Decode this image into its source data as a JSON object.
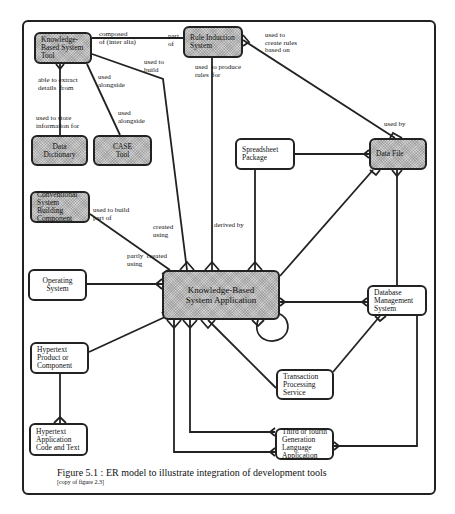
{
  "diagram": {
    "type": "ER model",
    "entities": [
      {
        "id": "kbs_tool",
        "label": "Knowledge-Based System Tool",
        "shaded": true
      },
      {
        "id": "rule_induction",
        "label": "Rule Induction System",
        "shaded": true
      },
      {
        "id": "data_dictionary",
        "label": "Data Dictionary",
        "shaded": true
      },
      {
        "id": "case_tool",
        "label": "CASE Tool",
        "shaded": true
      },
      {
        "id": "spreadsheet",
        "label": "Spreadsheet Package",
        "shaded": false
      },
      {
        "id": "data_file",
        "label": "Data File",
        "shaded": true
      },
      {
        "id": "conventional",
        "label": "Conventional System Building Component",
        "shaded": true
      },
      {
        "id": "operating_system",
        "label": "Operating System",
        "shaded": false
      },
      {
        "id": "kbs_application",
        "label": "Knowledge-Based System Application",
        "shaded": true
      },
      {
        "id": "dbms",
        "label": "Database Management System",
        "shaded": false
      },
      {
        "id": "hypertext_product",
        "label": "Hypertext Product or Component",
        "shaded": false
      },
      {
        "id": "hypertext_code",
        "label": "Hypertext Application Code and Text",
        "shaded": false
      },
      {
        "id": "transaction",
        "label": "Transaction Processing Service",
        "shaded": false
      },
      {
        "id": "generation_language",
        "label": "Third or fourth Generation Language Application",
        "shaded": false
      }
    ],
    "relationships": [
      {
        "from": "kbs_tool",
        "to": "rule_induction",
        "label_from": "composed of (inter alia)",
        "label_to": "part of"
      },
      {
        "from": "kbs_tool",
        "to": "data_dictionary",
        "label_from": "able to extract details from",
        "label_to": "used to store information for"
      },
      {
        "from": "kbs_tool",
        "to": "case_tool",
        "label_from": "used alongside",
        "label_to": "used alongside"
      },
      {
        "from": "kbs_tool",
        "to": "kbs_application",
        "label_from": "used to build",
        "label_to": "created using"
      },
      {
        "from": "rule_induction",
        "to": "kbs_application",
        "label_from": "used to produce rules for",
        "label_to": "derived by"
      },
      {
        "from": "rule_induction",
        "to": "data_file",
        "label_from": "used to create rules based on",
        "label_to": "used by"
      },
      {
        "from": "spreadsheet",
        "to": "data_file",
        "label_from": "",
        "label_to": ""
      },
      {
        "from": "spreadsheet",
        "to": "kbs_application",
        "label_from": "",
        "label_to": ""
      },
      {
        "from": "conventional",
        "to": "kbs_application",
        "label_from": "used to build part of",
        "label_to": "partly created using"
      },
      {
        "from": "operating_system",
        "to": "kbs_application",
        "label_from": "",
        "label_to": ""
      },
      {
        "from": "kbs_application",
        "to": "data_file",
        "label_from": "",
        "label_to": ""
      },
      {
        "from": "kbs_application",
        "to": "dbms",
        "label_from": "",
        "label_to": ""
      },
      {
        "from": "kbs_application",
        "to": "kbs_application",
        "label_from": "",
        "label_to": ""
      },
      {
        "from": "dbms",
        "to": "data_file",
        "label_from": "",
        "label_to": ""
      },
      {
        "from": "hypertext_product",
        "to": "kbs_application",
        "label_from": "",
        "label_to": ""
      },
      {
        "from": "hypertext_product",
        "to": "hypertext_code",
        "label_from": "",
        "label_to": ""
      },
      {
        "from": "kbs_application",
        "to": "transaction",
        "label_from": "",
        "label_to": ""
      },
      {
        "from": "dbms",
        "to": "transaction",
        "label_from": "",
        "label_to": ""
      },
      {
        "from": "kbs_application",
        "to": "generation_language",
        "label_from": "",
        "label_to": ""
      },
      {
        "from": "dbms",
        "to": "generation_language",
        "label_from": "",
        "label_to": ""
      }
    ],
    "labels": {
      "composed_of": "composed\nof (inter alia)",
      "part_of": "part\nof",
      "able_to_extract": "able to extract\ndetails  from",
      "used_to_store": "used to store\ninformation for",
      "used_alongside_1": "used\nalongside",
      "used_alongside_2": "used\nalongside",
      "used_to_build": "used to\nbuild",
      "used_to_produce": "used  to produce\nrules  for",
      "used_to_create": "used to\ncreate rules\nbased on",
      "used_by": "used by",
      "used_to_build_part": "used to build\npart of",
      "created_using": "created\nusing",
      "partly_created": "partly  created\nusing",
      "derived_by": "derived by"
    }
  },
  "caption": {
    "title": "Figure 5.1 : ER model to illustrate integration  of  development tools",
    "subtitle": "[copy of figure 2.3]"
  }
}
